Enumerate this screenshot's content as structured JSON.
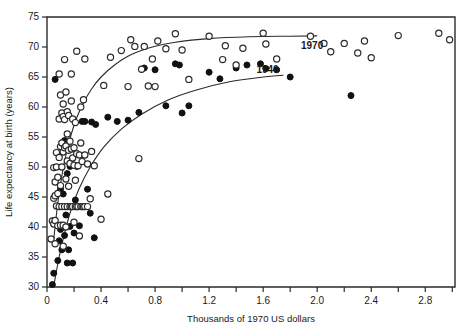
{
  "chart_data": {
    "type": "scatter",
    "title": "",
    "xlabel": "Thousands of 1970 US dollars",
    "ylabel": "Life expectancy at birth (years)",
    "xlim": [
      0,
      3.02
    ],
    "ylim": [
      30,
      75
    ],
    "grid": false,
    "legend_position": "inline-curve-labels",
    "xticks_major": [
      0,
      0.4,
      0.8,
      1.2,
      1.6,
      2.0,
      2.4,
      2.8
    ],
    "xtick_labels": [
      "0",
      "0.4",
      "0.8",
      "1.2",
      "1.6",
      "2.0",
      "2.4",
      "2.8"
    ],
    "xticks_minor": [
      0.2,
      0.6,
      1.0,
      1.4,
      1.8,
      2.2,
      2.6,
      3.0
    ],
    "yticks": [
      30,
      35,
      40,
      45,
      50,
      55,
      60,
      65,
      70,
      75
    ],
    "ytick_labels": [
      "30",
      "35",
      "40",
      "45",
      "50",
      "55",
      "60",
      "65",
      "70",
      "75"
    ],
    "series": [
      {
        "name": "1970",
        "marker": "open-circle",
        "label": "1970",
        "label_x": 1.88,
        "label_y": 69.6,
        "color": "#2b2b2b",
        "points": [
          [
            0.03,
            38.0
          ],
          [
            0.04,
            41.0
          ],
          [
            0.05,
            40.5
          ],
          [
            0.05,
            44.8
          ],
          [
            0.05,
            49.9
          ],
          [
            0.06,
            37.2
          ],
          [
            0.06,
            41.1
          ],
          [
            0.06,
            45.2
          ],
          [
            0.06,
            47.5
          ],
          [
            0.07,
            43.5
          ],
          [
            0.07,
            50.0
          ],
          [
            0.07,
            52.4
          ],
          [
            0.08,
            40.2
          ],
          [
            0.08,
            45.6
          ],
          [
            0.08,
            48.3
          ],
          [
            0.09,
            43.4
          ],
          [
            0.09,
            51.6
          ],
          [
            0.09,
            58.0
          ],
          [
            0.09,
            65.5
          ],
          [
            0.1,
            40.3
          ],
          [
            0.1,
            46.9
          ],
          [
            0.1,
            53.4
          ],
          [
            0.1,
            62.0
          ],
          [
            0.11,
            43.4
          ],
          [
            0.11,
            50.0
          ],
          [
            0.11,
            54.0
          ],
          [
            0.11,
            59.0
          ],
          [
            0.12,
            36.8
          ],
          [
            0.12,
            40.3
          ],
          [
            0.12,
            52.5
          ],
          [
            0.12,
            58.4
          ],
          [
            0.12,
            60.5
          ],
          [
            0.13,
            43.4
          ],
          [
            0.13,
            53.2
          ],
          [
            0.13,
            57.9
          ],
          [
            0.13,
            67.9
          ],
          [
            0.14,
            40.0
          ],
          [
            0.14,
            48.0
          ],
          [
            0.14,
            53.5
          ],
          [
            0.14,
            62.5
          ],
          [
            0.15,
            43.4
          ],
          [
            0.15,
            51.0
          ],
          [
            0.15,
            55.5
          ],
          [
            0.15,
            59.2
          ],
          [
            0.16,
            46.8
          ],
          [
            0.16,
            52.8
          ],
          [
            0.16,
            58.6
          ],
          [
            0.17,
            43.4
          ],
          [
            0.17,
            50.6
          ],
          [
            0.17,
            54.3
          ],
          [
            0.18,
            43.4
          ],
          [
            0.18,
            53.0
          ],
          [
            0.18,
            61.0
          ],
          [
            0.18,
            65.5
          ],
          [
            0.19,
            43.4
          ],
          [
            0.19,
            51.5
          ],
          [
            0.19,
            58.0
          ],
          [
            0.2,
            40.8
          ],
          [
            0.2,
            50.3
          ],
          [
            0.2,
            53.2
          ],
          [
            0.21,
            43.4
          ],
          [
            0.21,
            47.8
          ],
          [
            0.21,
            57.4
          ],
          [
            0.22,
            43.4
          ],
          [
            0.22,
            52.2
          ],
          [
            0.22,
            69.3
          ],
          [
            0.23,
            43.4
          ],
          [
            0.23,
            50.2
          ],
          [
            0.24,
            38.5
          ],
          [
            0.24,
            52.0
          ],
          [
            0.25,
            43.4
          ],
          [
            0.25,
            54.0
          ],
          [
            0.25,
            60.0
          ],
          [
            0.26,
            43.4
          ],
          [
            0.26,
            50.9
          ],
          [
            0.27,
            43.4
          ],
          [
            0.27,
            61.2
          ],
          [
            0.28,
            43.4
          ],
          [
            0.28,
            52.0
          ],
          [
            0.28,
            68.0
          ],
          [
            0.3,
            43.4
          ],
          [
            0.3,
            50.5
          ],
          [
            0.32,
            44.7
          ],
          [
            0.33,
            52.6
          ],
          [
            0.35,
            50.2
          ],
          [
            0.4,
            41.3
          ],
          [
            0.42,
            63.6
          ],
          [
            0.45,
            45.5
          ],
          [
            0.47,
            68.3
          ],
          [
            0.55,
            69.4
          ],
          [
            0.6,
            63.4
          ],
          [
            0.62,
            71.2
          ],
          [
            0.65,
            70.1
          ],
          [
            0.68,
            51.4
          ],
          [
            0.7,
            66.3
          ],
          [
            0.72,
            70.1
          ],
          [
            0.75,
            63.5
          ],
          [
            0.78,
            68.0
          ],
          [
            0.8,
            63.4
          ],
          [
            0.82,
            71.0
          ],
          [
            0.88,
            69.7
          ],
          [
            0.95,
            72.2
          ],
          [
            1.0,
            69.5
          ],
          [
            1.05,
            64.6
          ],
          [
            1.2,
            71.8
          ],
          [
            1.3,
            67.9
          ],
          [
            1.32,
            70.2
          ],
          [
            1.4,
            67.0
          ],
          [
            1.45,
            69.8
          ],
          [
            1.6,
            72.3
          ],
          [
            1.62,
            70.5
          ],
          [
            1.7,
            68.0
          ],
          [
            1.95,
            71.8
          ],
          [
            2.05,
            70.6
          ],
          [
            2.1,
            69.2
          ],
          [
            2.2,
            70.6
          ],
          [
            2.3,
            69.0
          ],
          [
            2.35,
            71.0
          ],
          [
            2.4,
            68.2
          ],
          [
            2.6,
            71.9
          ],
          [
            2.9,
            72.3
          ],
          [
            2.98,
            71.2
          ]
        ]
      },
      {
        "name": "1940",
        "marker": "filled-circle",
        "label": "1940",
        "label_x": 1.55,
        "label_y": 65.6,
        "color": "#111111",
        "points": [
          [
            0.04,
            30.4
          ],
          [
            0.05,
            32.3
          ],
          [
            0.06,
            64.6
          ],
          [
            0.08,
            34.4
          ],
          [
            0.09,
            37.7
          ],
          [
            0.1,
            39.6
          ],
          [
            0.1,
            46.3
          ],
          [
            0.11,
            36.2
          ],
          [
            0.12,
            40.0
          ],
          [
            0.12,
            45.5
          ],
          [
            0.13,
            38.6
          ],
          [
            0.13,
            54.4
          ],
          [
            0.14,
            42.0
          ],
          [
            0.15,
            34.0
          ],
          [
            0.15,
            48.9
          ],
          [
            0.16,
            36.2
          ],
          [
            0.17,
            40.1
          ],
          [
            0.17,
            50.1
          ],
          [
            0.19,
            34.0
          ],
          [
            0.2,
            39.0
          ],
          [
            0.21,
            44.5
          ],
          [
            0.22,
            50.1
          ],
          [
            0.24,
            40.2
          ],
          [
            0.26,
            57.6
          ],
          [
            0.28,
            57.6
          ],
          [
            0.3,
            46.3
          ],
          [
            0.32,
            42.3
          ],
          [
            0.33,
            57.5
          ],
          [
            0.35,
            38.2
          ],
          [
            0.36,
            57.1
          ],
          [
            0.45,
            58.3
          ],
          [
            0.52,
            57.6
          ],
          [
            0.6,
            57.8
          ],
          [
            0.68,
            59.1
          ],
          [
            0.72,
            66.5
          ],
          [
            0.8,
            66.2
          ],
          [
            0.88,
            60.2
          ],
          [
            0.95,
            67.2
          ],
          [
            0.98,
            67.0
          ],
          [
            1.0,
            59.0
          ],
          [
            1.05,
            60.2
          ],
          [
            1.2,
            65.8
          ],
          [
            1.28,
            64.7
          ],
          [
            1.4,
            66.5
          ],
          [
            1.48,
            67.0
          ],
          [
            1.58,
            67.2
          ],
          [
            1.62,
            66.4
          ],
          [
            1.7,
            66.2
          ],
          [
            1.8,
            65.0
          ],
          [
            2.25,
            61.9
          ]
        ]
      }
    ],
    "fit_curves": [
      {
        "name": "1970-fit",
        "for_series": "1970",
        "type": "logarithmic",
        "points": [
          [
            0.05,
            38.0
          ],
          [
            0.08,
            44.0
          ],
          [
            0.11,
            48.5
          ],
          [
            0.14,
            52.0
          ],
          [
            0.18,
            55.5
          ],
          [
            0.22,
            58.2
          ],
          [
            0.27,
            60.7
          ],
          [
            0.33,
            63.0
          ],
          [
            0.4,
            65.0
          ],
          [
            0.5,
            67.0
          ],
          [
            0.62,
            68.7
          ],
          [
            0.78,
            70.0
          ],
          [
            0.95,
            70.8
          ],
          [
            1.2,
            71.4
          ],
          [
            1.5,
            71.7
          ],
          [
            1.8,
            71.8
          ],
          [
            2.0,
            71.85
          ]
        ]
      },
      {
        "name": "1940-fit",
        "for_series": "1940",
        "type": "logarithmic",
        "points": [
          [
            0.05,
            30.2
          ],
          [
            0.09,
            35.0
          ],
          [
            0.13,
            39.0
          ],
          [
            0.18,
            43.0
          ],
          [
            0.24,
            46.5
          ],
          [
            0.32,
            50.0
          ],
          [
            0.42,
            53.3
          ],
          [
            0.55,
            56.3
          ],
          [
            0.7,
            58.8
          ],
          [
            0.9,
            61.2
          ],
          [
            1.1,
            62.8
          ],
          [
            1.35,
            64.2
          ],
          [
            1.6,
            65.0
          ],
          [
            1.75,
            65.3
          ]
        ]
      }
    ]
  }
}
